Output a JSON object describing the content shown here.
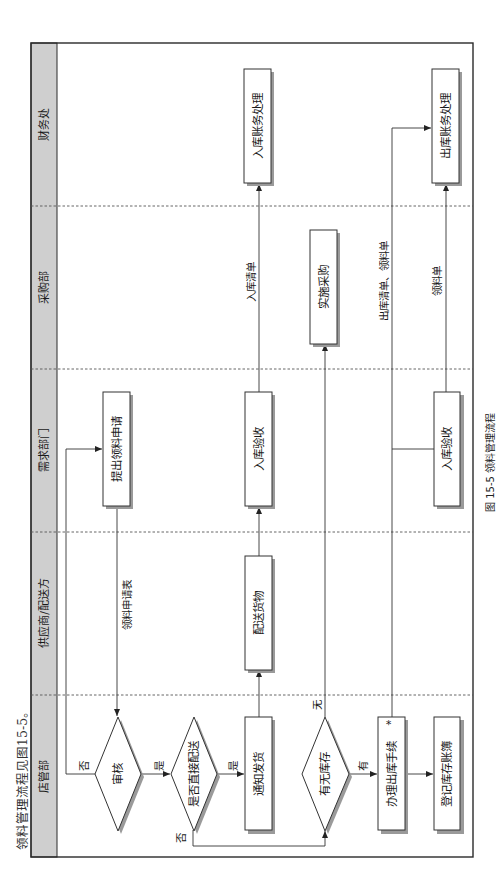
{
  "intro_text": "领料管理流程见图15-5。",
  "caption": "图 15-5  领料管理流程",
  "lanes": [
    {
      "id": "finance",
      "label": "财务处"
    },
    {
      "id": "purchasing",
      "label": "采购部"
    },
    {
      "id": "requester",
      "label": "需求部门"
    },
    {
      "id": "supplier",
      "label": "供应商/配送方"
    },
    {
      "id": "store_mgmt",
      "label": "店管部"
    }
  ],
  "nodes": {
    "submit_request": {
      "label": "提出领料申请",
      "shape": "process",
      "lane": "需求部门"
    },
    "review": {
      "label": "审核",
      "shape": "decision",
      "lane": "店管部"
    },
    "direct_delivery": {
      "label": "是否直接配送",
      "shape": "decision",
      "lane": "店管部"
    },
    "notify_shipment": {
      "label": "通知发货",
      "shape": "process",
      "lane": "店管部"
    },
    "deliver_goods": {
      "label": "配送货物",
      "shape": "process",
      "lane": "供应商/配送方"
    },
    "inbound_inspection_1": {
      "label": "入库验收",
      "shape": "process",
      "lane": "需求部门"
    },
    "inbound_accounting": {
      "label": "入库账务处理",
      "shape": "process",
      "lane": "财务处"
    },
    "stock_check": {
      "label": "有无库存",
      "shape": "decision",
      "lane": "店管部"
    },
    "purchase": {
      "label": "实施采购",
      "shape": "process",
      "lane": "采购部"
    },
    "outbound_procedure": {
      "label": "办理出库手续",
      "shape": "process",
      "lane": "店管部"
    },
    "register_ledger": {
      "label": "登记库存账簿",
      "shape": "process",
      "lane": "店管部"
    },
    "inbound_inspection_2": {
      "label": "入库验收",
      "shape": "process",
      "lane": "需求部门"
    },
    "outbound_accounting": {
      "label": "出库账务处理",
      "shape": "process",
      "lane": "财务处"
    }
  },
  "edges": {
    "request_form": "领料申请表",
    "review_no": "否",
    "review_yes": "是",
    "direct_yes": "是",
    "direct_no": "否",
    "stock_none": "无",
    "stock_have": "有",
    "inbound_list": "入库清单",
    "outbound_list": "出库清单、领料单",
    "requisition": "领料单"
  },
  "outbound_mark": "*"
}
